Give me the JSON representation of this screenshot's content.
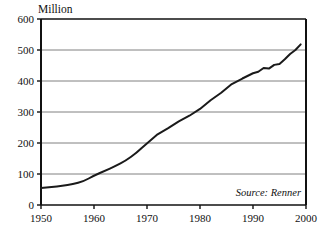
{
  "chart_data": {
    "type": "line",
    "title": "",
    "subtitle": "",
    "ylabel": "Million",
    "xlabel": "",
    "xlim": [
      1950,
      2000
    ],
    "ylim": [
      0,
      600
    ],
    "grid": true,
    "legend_position": "none",
    "annotations": [
      {
        "name": "source",
        "text": "Source: Renner",
        "position": "bottom-right-inside"
      }
    ],
    "yticks": [
      0,
      100,
      200,
      300,
      400,
      500,
      600
    ],
    "ytick_labels": [
      "0",
      "100",
      "200",
      "300",
      "400",
      "500",
      "600"
    ],
    "xticks": [
      1950,
      1960,
      1970,
      1980,
      1990,
      2000
    ],
    "xtick_labels": [
      "1950",
      "1960",
      "1970",
      "1980",
      "1990",
      "2000"
    ],
    "series": [
      {
        "name": "Bicycle Production",
        "color": "#1a1a1a",
        "x": [
          1950,
          1952,
          1954,
          1956,
          1958,
          1960,
          1962,
          1964,
          1966,
          1968,
          1970,
          1972,
          1974,
          1976,
          1978,
          1980,
          1982,
          1984,
          1986,
          1988,
          1990,
          1991,
          1992,
          1993,
          1994,
          1995,
          1996,
          1997,
          1998,
          1999
        ],
        "values": [
          55,
          58,
          62,
          67,
          76,
          95,
          110,
          125,
          143,
          168,
          200,
          228,
          248,
          270,
          288,
          310,
          338,
          362,
          390,
          408,
          425,
          430,
          442,
          440,
          452,
          455,
          470,
          487,
          500,
          518
        ]
      }
    ]
  },
  "colors": {
    "axis": "#111111",
    "grid": "#808080",
    "line": "#1a1a1a",
    "background": "#ffffff"
  },
  "geometry": {
    "plot_left": 41,
    "plot_right": 306,
    "plot_top": 19,
    "plot_bottom": 205
  }
}
